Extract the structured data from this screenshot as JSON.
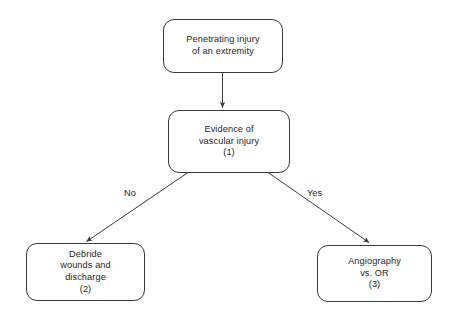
{
  "diagram": {
    "background_color": "#ffffff",
    "stroke_color": "#3a3a3a",
    "text_color": "#262626",
    "nodes": [
      {
        "id": "node-penetrating-injury",
        "shape": "rounded-rectangle",
        "lines": [
          "Penetrating injury",
          "of an extremity"
        ],
        "line1": "Penetrating injury",
        "line2": "of an extremity",
        "line3": "",
        "line4": ""
      },
      {
        "id": "node-evidence-vascular-injury",
        "shape": "rounded-rectangle",
        "lines": [
          "Evidence of",
          "vascular injury",
          "(1)"
        ],
        "line1": "Evidence of",
        "line2": "vascular injury",
        "line3": "(1)",
        "line4": ""
      },
      {
        "id": "node-debride-wounds",
        "shape": "rounded-rectangle",
        "lines": [
          "Debride",
          "wounds and",
          "discharge",
          "(2)"
        ],
        "line1": "Debride",
        "line2": "wounds and",
        "line3": "discharge",
        "line4": "(2)"
      },
      {
        "id": "node-angiography-or",
        "shape": "rounded-rectangle",
        "lines": [
          "Angiography",
          "vs. OR",
          "(3)"
        ],
        "line1": "Angiography",
        "line2": "vs. OR",
        "line3": "(3)",
        "line4": ""
      }
    ],
    "edges": [
      {
        "id": "edge-injury-to-evidence",
        "from": "node-penetrating-injury",
        "to": "node-evidence-vascular-injury",
        "label": ""
      },
      {
        "id": "edge-evidence-no",
        "from": "node-evidence-vascular-injury",
        "to": "node-debride-wounds",
        "label": "No"
      },
      {
        "id": "edge-evidence-yes",
        "from": "node-evidence-vascular-injury",
        "to": "node-angiography-or",
        "label": "Yes"
      }
    ]
  }
}
